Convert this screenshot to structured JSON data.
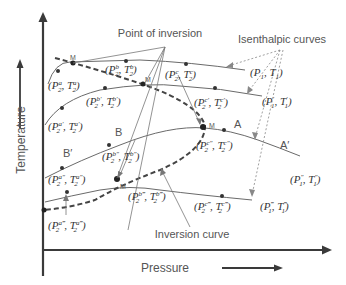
{
  "diagram": {
    "title_labels": {
      "point_of_inversion": "Point of inversion",
      "isenthalpic_curves": "Isenthalpic curves",
      "inversion_curve": "Inversion curve"
    },
    "axes": {
      "x_label": "Pressure",
      "y_label": "Temperature"
    },
    "region_labels": {
      "A": "A",
      "A_prime": "A′",
      "B": "B",
      "B_prime": "B′"
    },
    "maximum_markers": [
      "M",
      "M",
      "M",
      "M"
    ],
    "state_points": {
      "p1_t1": "(P1, T1)",
      "p1p_t1p": "(P1′, T1′)",
      "p1pp_t1pp": "(P1″, T1″)",
      "p1ppp_t1ppp": "(P1‴, T1‴)",
      "a": "(P2a, T2a)",
      "b": "(P2b, T2b)",
      "c": "(P2c, T2c)",
      "a1": "(P2a′, T2a′)",
      "b1": "(P2b′, T2b′)",
      "c1": "(P2c′, T2c′)",
      "a2": "(P2a″, T2a″)",
      "b2": "(P2b″, T2b″)",
      "c2": "(P2c″, T2c″)",
      "a3": "(P2a‴, T2a‴)",
      "b3": "(P2b‴, T2b‴)",
      "c3": "(P2c‴, T2c‴)"
    },
    "subscripts": {
      "one": "1",
      "two": "2"
    },
    "primes": {
      "p0": "",
      "p1": "′",
      "p2": "″",
      "p3": "‴"
    },
    "letters": {
      "P": "P",
      "T": "T",
      "a": "a",
      "b": "b",
      "c": "c"
    }
  }
}
